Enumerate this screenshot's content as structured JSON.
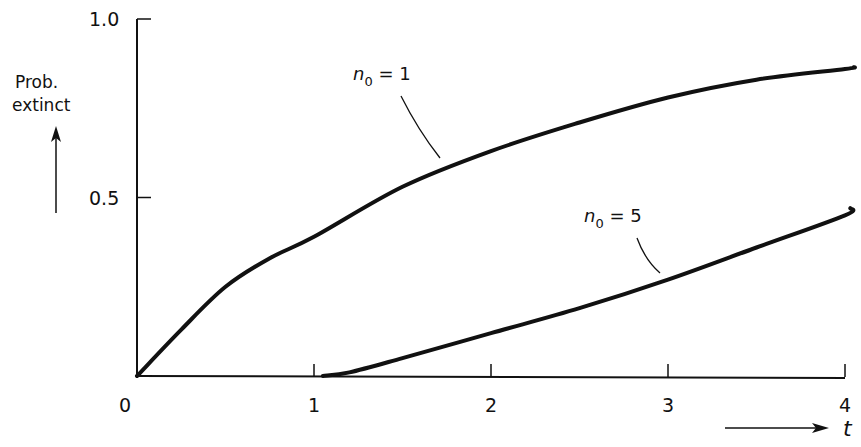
{
  "chart_data": {
    "type": "line",
    "title": "",
    "xlabel": "t",
    "ylabel": "Prob. extinct",
    "ylabel_lines": [
      "Prob.",
      "extinct"
    ],
    "xlim": [
      0,
      4
    ],
    "ylim": [
      0,
      1.0
    ],
    "grid": false,
    "legend": "none (inline curve labels)",
    "x_ticks": [
      0,
      1,
      2,
      3,
      4
    ],
    "x_tick_labels": [
      "0",
      "1",
      "2",
      "3",
      "4"
    ],
    "y_ticks": [
      0.5,
      1.0
    ],
    "y_tick_labels": [
      "0.5",
      "1.0"
    ],
    "origin_label": "0",
    "x": [
      0,
      0.5,
      1.0,
      1.05,
      1.5,
      2.0,
      2.5,
      3.0,
      3.5,
      4.0,
      4.05
    ],
    "series": [
      {
        "name": "n0 = 1",
        "label_main": "n",
        "label_sub": "0",
        "label_rest": " = 1",
        "points": [
          [
            0,
            0
          ],
          [
            0.25,
            0.13
          ],
          [
            0.5,
            0.25
          ],
          [
            0.75,
            0.33
          ],
          [
            1.0,
            0.39
          ],
          [
            1.5,
            0.53
          ],
          [
            2.0,
            0.63
          ],
          [
            2.5,
            0.71
          ],
          [
            3.0,
            0.78
          ],
          [
            3.5,
            0.83
          ],
          [
            4.0,
            0.86
          ],
          [
            4.05,
            0.865
          ]
        ],
        "color": "#111111"
      },
      {
        "name": "n0 = 5",
        "label_main": "n",
        "label_sub": "0",
        "label_rest": " = 5",
        "points": [
          [
            1.05,
            0.0
          ],
          [
            1.2,
            0.01
          ],
          [
            1.5,
            0.05
          ],
          [
            2.0,
            0.12
          ],
          [
            2.5,
            0.19
          ],
          [
            3.0,
            0.27
          ],
          [
            3.5,
            0.36
          ],
          [
            4.0,
            0.45
          ],
          [
            4.03,
            0.47
          ]
        ],
        "color": "#111111"
      }
    ],
    "annotations": [
      {
        "text": "n0 = 1",
        "points_to": [
          1.7,
          0.56
        ]
      },
      {
        "text": "n0 = 5",
        "points_to": [
          2.9,
          0.26
        ]
      }
    ]
  }
}
